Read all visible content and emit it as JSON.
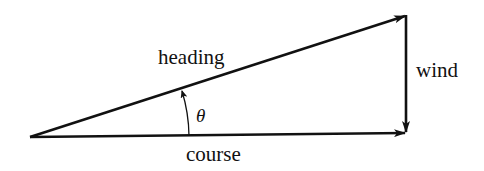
{
  "diagram": {
    "type": "vector-triangle",
    "labels": {
      "heading": "heading",
      "wind": "wind",
      "course": "course",
      "angle": "θ"
    },
    "colors": {
      "stroke": "#111111",
      "background": "#ffffff"
    }
  }
}
